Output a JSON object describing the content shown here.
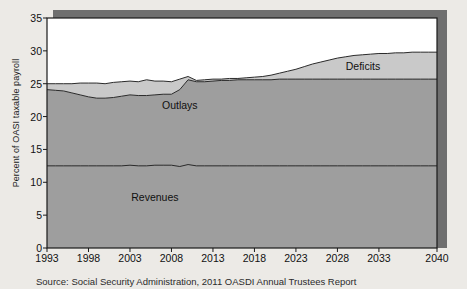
{
  "figure": {
    "source_note": "Source: Social Security Administration, 2011 OASDI Annual Trustees Report",
    "background_color": "#eceae6"
  },
  "chart_data": {
    "type": "area",
    "title": "",
    "subtitle": "",
    "xlabel": "",
    "ylabel": "Percent of OASI taxable payroll",
    "xlim": [
      1993,
      2040
    ],
    "ylim": [
      0,
      35
    ],
    "grid": false,
    "legend_position": "inline-annotations",
    "x_ticks": [
      1993,
      1998,
      2003,
      2008,
      2013,
      2018,
      2023,
      2028,
      2033,
      2040
    ],
    "x_tick_labels": [
      "1993",
      "1998",
      "2003",
      "2008",
      "2013",
      "2018",
      "2023",
      "2028",
      "2033",
      "2040"
    ],
    "y_ticks": [
      0,
      5,
      10,
      15,
      20,
      25,
      30,
      35
    ],
    "y_tick_labels": [
      "0",
      "5",
      "10",
      "15",
      "20",
      "25",
      "30",
      "35"
    ],
    "annotations": [
      {
        "text": "Deficits",
        "x": 2029,
        "y": 27.5
      },
      {
        "text": "Outlays",
        "x": 2009,
        "y": 21.6
      },
      {
        "text": "Revenues",
        "x": 2006,
        "y": 7.6
      }
    ],
    "colors": {
      "revenues_fill": "#9e9e9e",
      "outlays_fill": "#9e9e9e",
      "deficits_fill": "#c9c9c9",
      "line": "#2a2a2a",
      "frame": "#1a1a1a",
      "shadow": "#6f6f6f",
      "plot_background": "#ffffff"
    },
    "x": [
      1993,
      1994,
      1995,
      1996,
      1997,
      1998,
      1999,
      2000,
      2001,
      2002,
      2003,
      2004,
      2005,
      2006,
      2007,
      2008,
      2009,
      2010,
      2011,
      2012,
      2013,
      2014,
      2015,
      2016,
      2017,
      2018,
      2019,
      2020,
      2021,
      2022,
      2023,
      2024,
      2025,
      2026,
      2027,
      2028,
      2029,
      2030,
      2031,
      2032,
      2033,
      2034,
      2035,
      2036,
      2037,
      2038,
      2039,
      2040
    ],
    "series": [
      {
        "name": "Revenues",
        "values": [
          12.5,
          12.5,
          12.5,
          12.5,
          12.5,
          12.5,
          12.5,
          12.5,
          12.5,
          12.5,
          12.6,
          12.5,
          12.5,
          12.6,
          12.6,
          12.6,
          12.4,
          12.7,
          12.5,
          12.5,
          12.5,
          12.5,
          12.5,
          12.5,
          12.5,
          12.5,
          12.5,
          12.5,
          12.5,
          12.5,
          12.5,
          12.5,
          12.5,
          12.5,
          12.5,
          12.5,
          12.5,
          12.5,
          12.5,
          12.5,
          12.5,
          12.5,
          12.5,
          12.5,
          12.5,
          12.5,
          12.5,
          12.5
        ]
      },
      {
        "name": "Outlays",
        "values": [
          24.1,
          24.0,
          23.9,
          23.6,
          23.3,
          23.0,
          22.8,
          22.8,
          22.9,
          23.1,
          23.3,
          23.2,
          23.2,
          23.3,
          23.4,
          23.4,
          24.1,
          25.6,
          25.3,
          25.3,
          25.4,
          25.5,
          25.5,
          25.6,
          25.6,
          25.6,
          25.6,
          25.6,
          25.7,
          25.7,
          25.7,
          25.7,
          25.7,
          25.7,
          25.7,
          25.7,
          25.7,
          25.7,
          25.7,
          25.7,
          25.7,
          25.7,
          25.7,
          25.7,
          25.7,
          25.7,
          25.7,
          25.7
        ]
      },
      {
        "name": "Total cost (Outlays + Deficits)",
        "values": [
          25.0,
          25.0,
          25.0,
          25.0,
          25.1,
          25.1,
          25.1,
          25.0,
          25.2,
          25.3,
          25.4,
          25.3,
          25.6,
          25.4,
          25.4,
          25.3,
          25.7,
          26.1,
          25.5,
          25.6,
          25.7,
          25.7,
          25.8,
          25.8,
          25.9,
          26.0,
          26.1,
          26.3,
          26.6,
          26.9,
          27.2,
          27.6,
          28.0,
          28.3,
          28.6,
          28.9,
          29.1,
          29.3,
          29.4,
          29.5,
          29.6,
          29.6,
          29.7,
          29.7,
          29.8,
          29.8,
          29.8,
          29.8
        ]
      }
    ]
  }
}
